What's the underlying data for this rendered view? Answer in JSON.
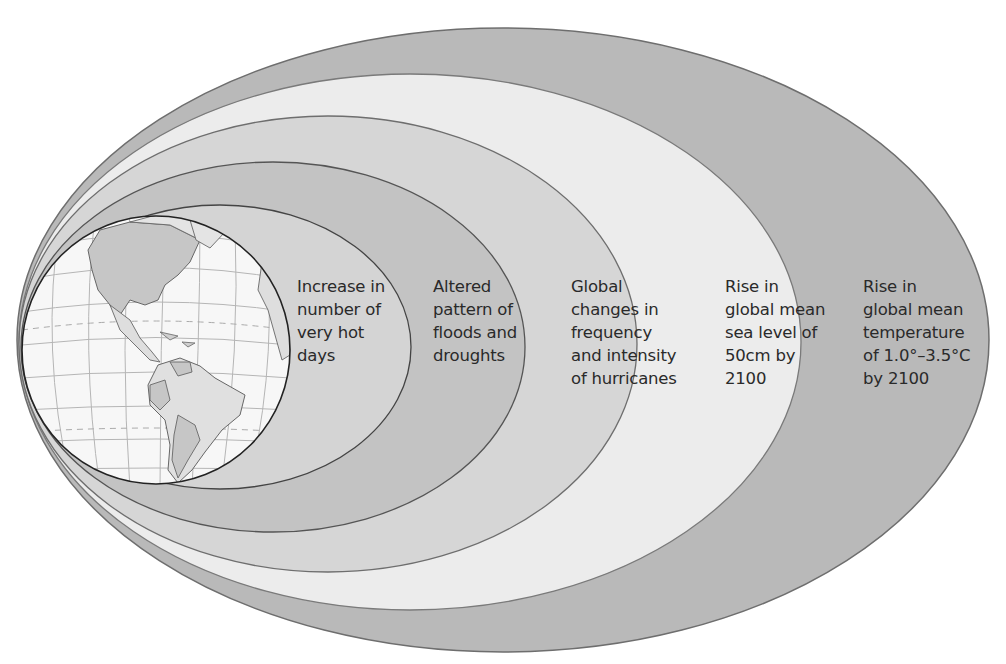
{
  "diagram": {
    "title": "",
    "center_object": "globe (Americas)",
    "rings": [
      {
        "id": "ring-1",
        "label": "Increase in\nnumber of\nvery hot\ndays",
        "fill": "#d4d4d4"
      },
      {
        "id": "ring-2",
        "label": "Altered\npattern of\nfloods and\ndroughts",
        "fill": "#c3c3c3"
      },
      {
        "id": "ring-3",
        "label": "Global\nchanges in\nfrequency\nand intensity\nof hurricanes",
        "fill": "#d6d6d6"
      },
      {
        "id": "ring-4",
        "label": "Rise in\nglobal mean\nsea level of\n50cm by\n2100",
        "fill": "#ececec"
      },
      {
        "id": "ring-5",
        "label": "Rise in\nglobal mean\ntemperature\nof 1.0°–3.5°C\nby 2100",
        "fill": "#b9b9b9"
      }
    ],
    "colors": {
      "outline": "#6e6e6e",
      "globe_ocean": "#f7f7f7",
      "globe_land": "#dedede",
      "globe_land_dark": "#c6c6c6",
      "graticule": "#b5b5b5"
    }
  }
}
